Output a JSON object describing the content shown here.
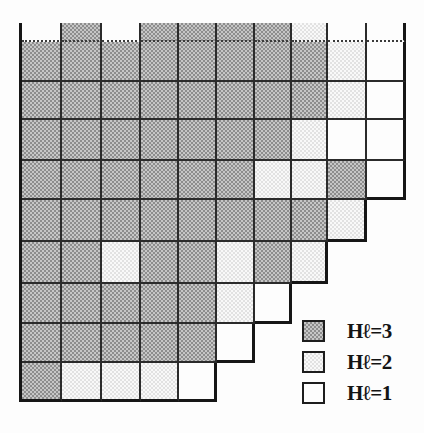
{
  "chart_data": {
    "type": "heatmap",
    "title": "",
    "xlabel": "",
    "ylabel": "",
    "grid": "staircase-shaped block grid, 10 columns, clipped partial top row, right edge steps in by one column per row over the last five rows",
    "value_labels": {
      "3": "Hℓ=3",
      "2": "Hℓ=2",
      "1": "Hℓ=1"
    },
    "matrix": [
      [
        1,
        3,
        1,
        3,
        3,
        3,
        3,
        2,
        1,
        1
      ],
      [
        3,
        3,
        3,
        3,
        3,
        3,
        3,
        3,
        2,
        1
      ],
      [
        3,
        3,
        3,
        3,
        3,
        3,
        3,
        3,
        2,
        1
      ],
      [
        3,
        3,
        3,
        3,
        3,
        3,
        3,
        2,
        1,
        1
      ],
      [
        3,
        3,
        3,
        3,
        3,
        3,
        2,
        2,
        3,
        1
      ],
      [
        3,
        3,
        3,
        3,
        3,
        3,
        3,
        3,
        2,
        null
      ],
      [
        3,
        3,
        2,
        3,
        3,
        2,
        3,
        2,
        null,
        null
      ],
      [
        3,
        3,
        3,
        3,
        3,
        2,
        1,
        null,
        null,
        null
      ],
      [
        3,
        3,
        3,
        3,
        3,
        1,
        null,
        null,
        null,
        null
      ],
      [
        3,
        2,
        2,
        2,
        1,
        null,
        null,
        null,
        null,
        null
      ]
    ],
    "legend_position": "bottom-right"
  },
  "legend": {
    "items": [
      {
        "label": "Hℓ=3",
        "level": 3
      },
      {
        "label": "Hℓ=2",
        "level": 2
      },
      {
        "label": "Hℓ=1",
        "level": 1
      }
    ]
  },
  "colors": {
    "hl3_dot": "#8d8d8d",
    "hl3_base": "#c6c6c6",
    "hl2_dot": "#e2e2e2",
    "hl2_base": "#f9f9f9",
    "hl1": "#fdfdfd",
    "grid_line": "#2b2b2b",
    "outer_line": "#161616",
    "background": "#fdfdfd"
  }
}
